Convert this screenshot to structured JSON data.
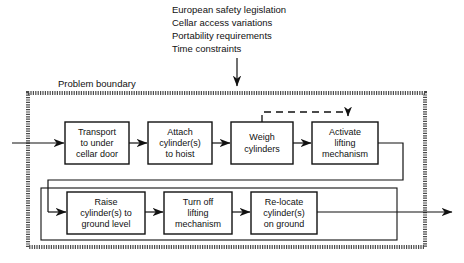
{
  "external_inputs": {
    "name": "external-influences",
    "lines": [
      "European safety legislation",
      "Cellar access variations",
      "Portability requirements",
      "Time constraints"
    ]
  },
  "boundary": {
    "label": "Problem boundary"
  },
  "rows": [
    {
      "name": "process-row-1",
      "boxes": [
        {
          "id": "transport",
          "lines": [
            "Transport",
            "to under",
            "cellar door"
          ]
        },
        {
          "id": "attach",
          "lines": [
            "Attach",
            "cylinder(s)",
            "to hoist"
          ]
        },
        {
          "id": "weigh",
          "lines": [
            "Weigh",
            "cylinders"
          ]
        },
        {
          "id": "activate",
          "lines": [
            "Activate",
            "lifting",
            "mechanism"
          ]
        }
      ]
    },
    {
      "name": "process-row-2",
      "boxes": [
        {
          "id": "raise",
          "lines": [
            "Raise",
            "cylinder(s) to",
            "ground level"
          ]
        },
        {
          "id": "turnoff",
          "lines": [
            "Turn off",
            "lifting",
            "mechanism"
          ]
        },
        {
          "id": "relocate",
          "lines": [
            "Re-locate",
            "cylinder(s)",
            "on ground"
          ]
        }
      ]
    }
  ],
  "connectors": {
    "input_arrow": "process-input-arrow",
    "output_arrow": "process-output-arrow",
    "feedback": "weigh-to-activate-feedback-dashed",
    "wrap": "row1-to-row2-wrap"
  },
  "colors": {
    "line": "#111111",
    "boundary": "#4a4a4a",
    "background": "#ffffff"
  }
}
